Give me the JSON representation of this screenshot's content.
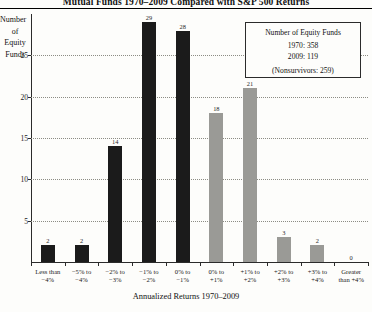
{
  "chart_data": {
    "type": "bar",
    "title": "Mutual Funds 1970–2009 Compared with S&P 500 Returns",
    "xlabel": "Annualized Returns 1970–2009",
    "ylabel": "Number of Equity Funds",
    "ylabel_lines": [
      "Number",
      "of",
      "Equity",
      "Funds"
    ],
    "ylim": [
      0,
      30
    ],
    "yticks": [
      5,
      10,
      15,
      20,
      25
    ],
    "grid": true,
    "legend_position": "top-right",
    "categories": [
      "Less than −4%",
      "−5% to −4%",
      "−2% to −3%",
      "−1% to −2%",
      "0% to −1%",
      "0% to +1%",
      "+1% to +2%",
      "+2% to +3%",
      "+3% to +4%",
      "Greater than +4%"
    ],
    "category_lines": [
      [
        "Less than",
        "−4%"
      ],
      [
        "−5% to",
        "−4%"
      ],
      [
        "−2% to",
        "−3%"
      ],
      [
        "−1% to",
        "−2%"
      ],
      [
        "0% to",
        "−1%"
      ],
      [
        "0% to",
        "+1%"
      ],
      [
        "+1% to",
        "+2%"
      ],
      [
        "+2% to",
        "+3%"
      ],
      [
        "+3% to",
        "+4%"
      ],
      [
        "Greater",
        "than +4%"
      ]
    ],
    "values": [
      2,
      2,
      14,
      29,
      28,
      18,
      21,
      3,
      2,
      0
    ],
    "bar_colors": [
      "#1b1b1b",
      "#1b1b1b",
      "#1b1b1b",
      "#1b1b1b",
      "#1b1b1b",
      "#9a9a96",
      "#9a9a96",
      "#9a9a96",
      "#9a9a96",
      "#9a9a96"
    ],
    "series": [
      {
        "name": "Number of Equity Funds",
        "values": [
          2,
          2,
          14,
          29,
          28,
          18,
          21,
          3,
          2,
          0
        ]
      }
    ],
    "colors": {
      "underperform": "#1b1b1b",
      "outperform": "#9a9a96",
      "axis": "#2b2b2b",
      "grid": "#8c8c84",
      "background": "#fdfdfb"
    }
  },
  "legend": {
    "title": "Number of Equity Funds",
    "rows": [
      "1970: 358",
      "2009: 119"
    ],
    "footnote": "(Nonsurvivors: 259)"
  }
}
